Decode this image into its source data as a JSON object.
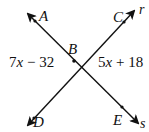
{
  "diagram": {
    "type": "intersecting-lines",
    "intersection_point": "B",
    "points": {
      "A": "A",
      "B": "B",
      "C": "C",
      "D": "D",
      "E": "E"
    },
    "rays": {
      "r": "r",
      "s": "s"
    },
    "lines": [
      {
        "name": "line-r",
        "through": [
          "D",
          "B",
          "C"
        ],
        "label": "r"
      },
      {
        "name": "line-s",
        "through": [
          "A",
          "B",
          "E"
        ],
        "label": "s"
      }
    ],
    "angles": {
      "left": {
        "between": [
          "A",
          "B",
          "D"
        ],
        "coef": "7",
        "var": "x",
        "op": " − ",
        "const": "32",
        "full": "7x − 32"
      },
      "right": {
        "between": [
          "C",
          "B",
          "E"
        ],
        "coef": "5",
        "var": "x",
        "op": " + ",
        "const": "18",
        "full": "5x + 18"
      }
    },
    "colors": {
      "line": "#111111",
      "background": "#ffffff"
    }
  }
}
